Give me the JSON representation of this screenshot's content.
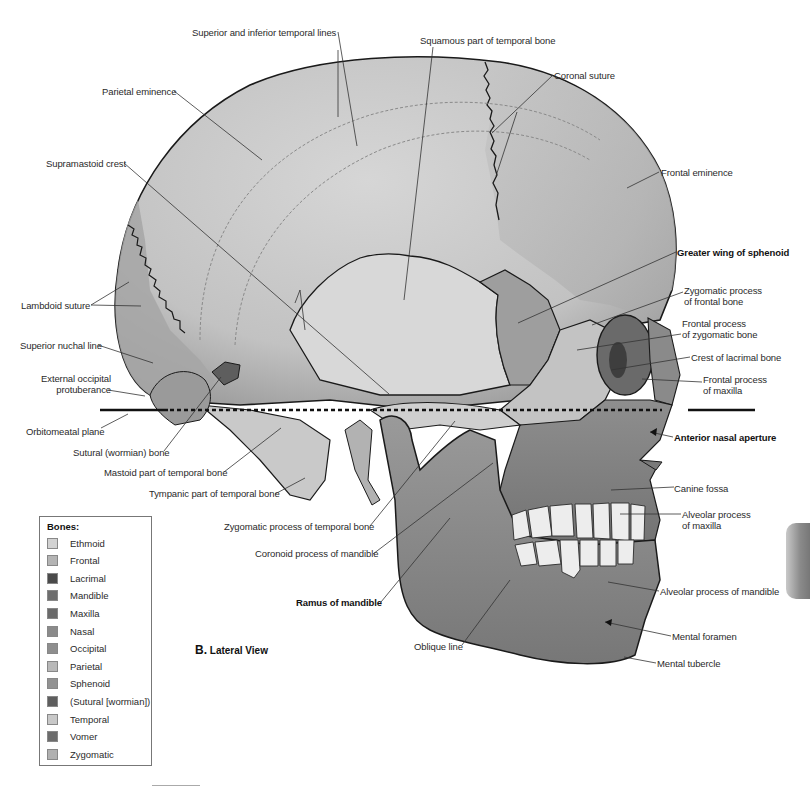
{
  "figure": {
    "view_letter": "B.",
    "view_title": "Lateral View",
    "plane_label": "Orbitomeatal plane"
  },
  "labels": [
    {
      "id": "superior-inferior-temporal-lines",
      "text": "Superior and inferior temporal lines",
      "x": 192,
      "y": 27,
      "bold": false
    },
    {
      "id": "squamous-temporal",
      "text": "Squamous part of temporal bone",
      "x": 420,
      "y": 35,
      "bold": false
    },
    {
      "id": "coronal-suture",
      "text": "Coronal suture",
      "x": 554,
      "y": 70,
      "bold": false
    },
    {
      "id": "parietal-eminence",
      "text": "Parietal eminence",
      "x": 102,
      "y": 86,
      "bold": false
    },
    {
      "id": "supramastoid-crest",
      "text": "Supramastoid crest",
      "x": 46,
      "y": 158,
      "bold": false
    },
    {
      "id": "frontal-eminence",
      "text": "Frontal eminence",
      "x": 661,
      "y": 167,
      "bold": false
    },
    {
      "id": "greater-wing-sphenoid",
      "text": "Greater wing of sphenoid",
      "x": 677,
      "y": 247,
      "bold": true
    },
    {
      "id": "lambdoid-suture",
      "text": "Lambdoid suture",
      "x": 21,
      "y": 300,
      "bold": false
    },
    {
      "id": "zygomatic-process-frontal",
      "text": "Zygomatic process\nof frontal bone",
      "x": 684,
      "y": 285,
      "bold": false
    },
    {
      "id": "frontal-process-zygomatic",
      "text": "Frontal process\nof zygomatic bone",
      "x": 682,
      "y": 318,
      "bold": false
    },
    {
      "id": "superior-nuchal-line",
      "text": "Superior nuchal line",
      "x": 20,
      "y": 340,
      "bold": false
    },
    {
      "id": "crest-lacrimal",
      "text": "Crest of lacrimal bone",
      "x": 691,
      "y": 352,
      "bold": false
    },
    {
      "id": "external-occipital-protuberance",
      "text": "External occipital\nprotuberance",
      "x": 41,
      "y": 373,
      "bold": false,
      "align": "right"
    },
    {
      "id": "frontal-process-maxilla",
      "text": "Frontal process\nof maxilla",
      "x": 703,
      "y": 374,
      "bold": false
    },
    {
      "id": "orbitomeatal-plane",
      "text": "Orbitomeatal plane",
      "x": 26,
      "y": 426,
      "bold": false
    },
    {
      "id": "anterior-nasal-aperture",
      "text": "Anterior nasal aperture",
      "x": 674,
      "y": 432,
      "bold": true
    },
    {
      "id": "sutural-wormian-bone",
      "text": "Sutural (wormian) bone",
      "x": 73,
      "y": 447,
      "bold": false
    },
    {
      "id": "mastoid-temporal",
      "text": "Mastoid part of temporal bone",
      "x": 104,
      "y": 467,
      "bold": false
    },
    {
      "id": "tympanic-temporal",
      "text": "Tympanic part of temporal bone",
      "x": 149,
      "y": 488,
      "bold": false
    },
    {
      "id": "canine-fossa",
      "text": "Canine fossa",
      "x": 674,
      "y": 483,
      "bold": false
    },
    {
      "id": "alveolar-maxilla",
      "text": "Alveolar process\nof maxilla",
      "x": 682,
      "y": 509,
      "bold": false
    },
    {
      "id": "zygomatic-process-temporal",
      "text": "Zygomatic process of temporal bone",
      "x": 224,
      "y": 521,
      "bold": false
    },
    {
      "id": "coronoid-mandible",
      "text": "Coronoid process of mandible",
      "x": 255,
      "y": 548,
      "bold": false
    },
    {
      "id": "alveolar-mandible",
      "text": "Alveolar process of mandible",
      "x": 660,
      "y": 586,
      "bold": false
    },
    {
      "id": "ramus-mandible",
      "text": "Ramus of mandible",
      "x": 296,
      "y": 597,
      "bold": true
    },
    {
      "id": "mental-foramen",
      "text": "Mental foramen",
      "x": 672,
      "y": 631,
      "bold": false
    },
    {
      "id": "oblique-line",
      "text": "Oblique line",
      "x": 414,
      "y": 641,
      "bold": false
    },
    {
      "id": "mental-tubercle",
      "text": "Mental tubercle",
      "x": 657,
      "y": 658,
      "bold": false
    }
  ],
  "legend": {
    "title": "Bones:",
    "items": [
      {
        "name": "Ethmoid",
        "color": "#d2d2d2"
      },
      {
        "name": "Frontal",
        "color": "#b4b4b4"
      },
      {
        "name": "Lacrimal",
        "color": "#4a4a4a"
      },
      {
        "name": "Mandible",
        "color": "#6e6e6e"
      },
      {
        "name": "Maxilla",
        "color": "#6a6a6a"
      },
      {
        "name": "Nasal",
        "color": "#8a8a8a"
      },
      {
        "name": "Occipital",
        "color": "#8e8e8e"
      },
      {
        "name": "Parietal",
        "color": "#b8b8b8"
      },
      {
        "name": "Sphenoid",
        "color": "#929292"
      },
      {
        "name": "(Sutural [wormian])",
        "color": "#5e5e5e"
      },
      {
        "name": "Temporal",
        "color": "#c8c8c8"
      },
      {
        "name": "Vomer",
        "color": "#6c6c6c"
      },
      {
        "name": "Zygomatic",
        "color": "#b0b0b0"
      }
    ]
  },
  "colors": {
    "outline": "#1a1a1a",
    "parietal": "#c4c4c4",
    "frontal": "#bcbcbc",
    "temporal": "#d4d4d4",
    "sphenoid": "#9a9a9a",
    "occipital": "#a4a4a4",
    "zygomatic": "#bdbdbd",
    "maxilla": "#7d7d7d",
    "mandible": "#828282",
    "teeth": "#ededed",
    "leader": "#333333"
  }
}
